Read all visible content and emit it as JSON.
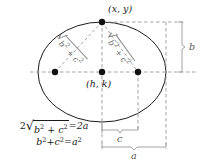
{
  "figure": {
    "type": "geometry-diagram",
    "background_color": "#ffffff",
    "ink_color": "#1a1a1a",
    "guide_color": "#9a9a9a",
    "dim_color": "#555555"
  },
  "labels": {
    "point_xy": "(x, y)",
    "center_hk": "(h, k)",
    "dim_b": "b",
    "dim_c": "c",
    "dim_a": "a"
  },
  "radicals": {
    "left": {
      "sign": "√",
      "body_b": "b",
      "body_b_exp": "2",
      "plus": " + ",
      "body_c": "c",
      "body_c_exp": "2"
    },
    "right": {
      "sign": "√",
      "body_b": "b",
      "body_b_exp": "2",
      "plus": " + ",
      "body_c": "c",
      "body_c_exp": "2"
    }
  },
  "equations": {
    "line1": {
      "lead": "2",
      "radical_sign": "√",
      "radicand_b": "b",
      "radicand_b_exp": "2",
      "radicand_plus": " + ",
      "radicand_c": "c",
      "radicand_c_exp": "2",
      "equals": " = ",
      "rhs": "2a",
      "plain": "2√(b² + c²) = 2a"
    },
    "line2": {
      "lhs_b": "b",
      "lhs_b_exp": "2",
      "lhs_plus": " + ",
      "lhs_c": "c",
      "lhs_c_exp": "2",
      "equals": " = ",
      "rhs": "a",
      "rhs_exp": "2",
      "plain": "b² + c² = a²"
    }
  },
  "geometry": {
    "ellipse_center_x": 102,
    "ellipse_center_y": 72,
    "ellipse_rx": 64,
    "ellipse_ry": 50,
    "focus_left_x": 55,
    "focus_right_x": 138,
    "focus_y": 72,
    "vertex_top_x": 102,
    "vertex_top_y": 22,
    "right_edge_x": 166,
    "bottom_y": 122,
    "bracket_b_x": 180,
    "bracket_c_y": 130,
    "bracket_a_y": 147
  }
}
